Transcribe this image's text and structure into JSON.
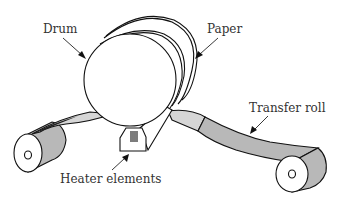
{
  "diagram": {
    "labels": {
      "drum": "Drum",
      "paper": "Paper",
      "transfer_roll": "Transfer roll",
      "heater_elements": "Heater elements"
    },
    "colors": {
      "belt_light": "#d6d6d6",
      "belt_dark": "#b8b8b8",
      "outline": "#111111",
      "background": "#ffffff"
    }
  }
}
